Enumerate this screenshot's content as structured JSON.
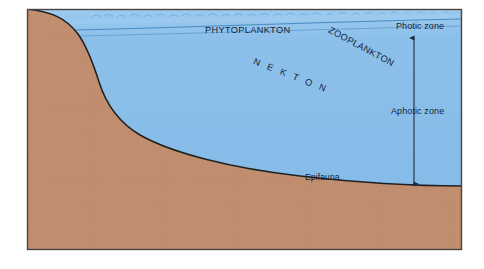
{
  "figure": {
    "colors": {
      "water": "#86BCE9",
      "water_surface_tint": "#9BCBEF",
      "sediment": "#C08E6E",
      "outline": "#20201e",
      "label_text": "#16243a",
      "thin_line": "#3C7FB8",
      "page_background": "#ffffff",
      "frame_border": "#4a4540"
    },
    "labels": {
      "phytoplankton": "PHYTOPLANKTON",
      "zooplankton": "ZOOPLANKTON",
      "nekton": "N E K T O N",
      "epifauna": "Epifauna",
      "photic_zone": "Photic zone",
      "aphotic_zone": "Aphotic zone"
    },
    "annotations": {
      "depth_arrow": "double-headed-depth-arrow"
    },
    "regions": [
      {
        "name": "water-body",
        "fill": "#86BCE9"
      },
      {
        "name": "seafloor-sediment",
        "fill": "#C08E6E"
      }
    ]
  }
}
